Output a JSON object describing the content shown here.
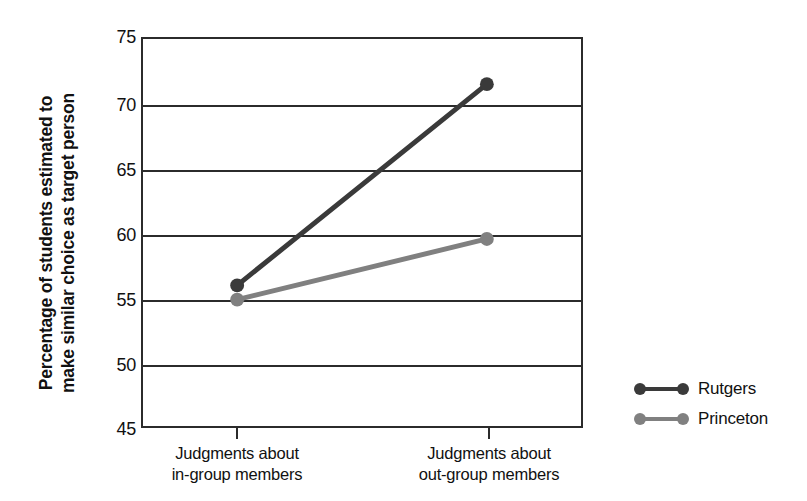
{
  "chart_data": {
    "type": "line",
    "title": "",
    "subtitle": "",
    "xlabel": "",
    "ylabel": "Percentage of students estimated to make similar choice as target person",
    "ylabel_line1": "Percentage of students estimated to",
    "ylabel_line2": "make similar choice as target person",
    "categories": [
      "Judgments about in-group members",
      "Judgments about out-group members"
    ],
    "category_lines": [
      [
        "Judgments about",
        "in-group members"
      ],
      [
        "Judgments about",
        "out-group members"
      ]
    ],
    "series": [
      {
        "name": "Rutgers",
        "values": [
          55.9,
          71.5
        ],
        "color": "#3a3a3a"
      },
      {
        "name": "Princeton",
        "values": [
          54.8,
          59.5
        ],
        "color": "#808080"
      }
    ],
    "ylim": [
      45,
      75
    ],
    "yticks": [
      75,
      70,
      65,
      60,
      55,
      50,
      45
    ],
    "ytick_labels": [
      "75",
      "70",
      "65",
      "60",
      "55",
      "50",
      "45"
    ],
    "grid": true,
    "grid_axis": "y",
    "legend_position": "right",
    "axis_color": "#2b2b2b",
    "background": "#ffffff"
  },
  "legend": {
    "entries": [
      {
        "label": "Rutgers",
        "color": "#3a3a3a"
      },
      {
        "label": "Princeton",
        "color": "#808080"
      }
    ]
  }
}
